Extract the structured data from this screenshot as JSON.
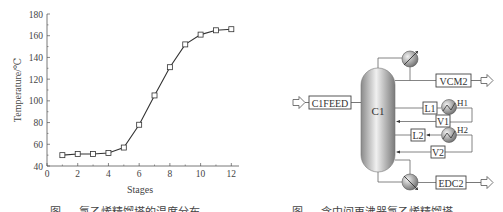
{
  "chart_data": {
    "type": "line",
    "title": "",
    "xlabel": "Stages",
    "ylabel": "Temperature/℃",
    "x": [
      1,
      2,
      3,
      4,
      5,
      6,
      7,
      8,
      9,
      10,
      11,
      12
    ],
    "series": [
      {
        "name": "Temperature",
        "marker": "open-square",
        "values": [
          50,
          51,
          51,
          52,
          57,
          78,
          105,
          131,
          152,
          161,
          165,
          166
        ]
      }
    ],
    "xlim": [
      0,
      12.5
    ],
    "ylim": [
      40,
      180
    ],
    "xticks": [
      "0",
      "2",
      "4",
      "6",
      "8",
      "10",
      "12"
    ],
    "yticks": [
      "40",
      "60",
      "80",
      "100",
      "120",
      "140",
      "160",
      "180"
    ],
    "grid": false,
    "legend": "none"
  },
  "left_caption": "图 — 氯乙烯精馏塔的温度分布",
  "diagram": {
    "column_label": "C1",
    "feed_label": "C1FEED",
    "top_product_label": "VCM2",
    "bottom_product_label": "EDC2",
    "heater_1_label": "H1",
    "heater_2_label": "H2",
    "liquid_1_label": "L1",
    "vapor_1_label": "V1",
    "liquid_2_label": "L2",
    "vapor_2_label": "V2"
  },
  "right_caption": "图 — 含中间再沸器氯乙烯精馏塔"
}
